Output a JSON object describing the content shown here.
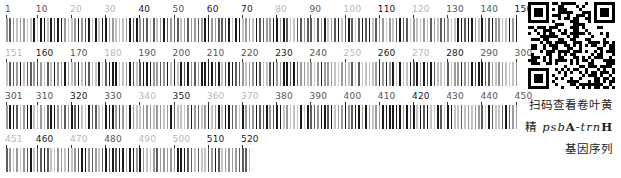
{
  "figure": {
    "rows": [
      {
        "start": 1,
        "end": 150,
        "labels": [
          {
            "text": "1",
            "pos": 1,
            "tone": "mid"
          },
          {
            "text": "10",
            "pos": 10,
            "tone": "mid"
          },
          {
            "text": "20",
            "pos": 20,
            "tone": "light"
          },
          {
            "text": "30",
            "pos": 30,
            "tone": "light"
          },
          {
            "text": "40",
            "pos": 40,
            "tone": "dark"
          },
          {
            "text": "50",
            "pos": 50,
            "tone": "mid"
          },
          {
            "text": "60",
            "pos": 60,
            "tone": "dark"
          },
          {
            "text": "70",
            "pos": 70,
            "tone": "dark"
          },
          {
            "text": "80",
            "pos": 80,
            "tone": "light"
          },
          {
            "text": "90",
            "pos": 90,
            "tone": "mid"
          },
          {
            "text": "100",
            "pos": 100,
            "tone": "light"
          },
          {
            "text": "110",
            "pos": 110,
            "tone": "dark"
          },
          {
            "text": "120",
            "pos": 120,
            "tone": "light"
          },
          {
            "text": "130",
            "pos": 130,
            "tone": "mid"
          },
          {
            "text": "140",
            "pos": 140,
            "tone": "mid"
          },
          {
            "text": "150",
            "pos": 150,
            "tone": "dark"
          }
        ]
      },
      {
        "start": 151,
        "end": 300,
        "labels": [
          {
            "text": "151",
            "pos": 151,
            "tone": "light"
          },
          {
            "text": "160",
            "pos": 160,
            "tone": "dark"
          },
          {
            "text": "170",
            "pos": 170,
            "tone": "mid"
          },
          {
            "text": "180",
            "pos": 180,
            "tone": "light"
          },
          {
            "text": "190",
            "pos": 190,
            "tone": "mid"
          },
          {
            "text": "200",
            "pos": 200,
            "tone": "mid"
          },
          {
            "text": "210",
            "pos": 210,
            "tone": "mid"
          },
          {
            "text": "220",
            "pos": 220,
            "tone": "mid"
          },
          {
            "text": "230",
            "pos": 230,
            "tone": "dark"
          },
          {
            "text": "240",
            "pos": 240,
            "tone": "mid"
          },
          {
            "text": "250",
            "pos": 250,
            "tone": "light"
          },
          {
            "text": "260",
            "pos": 260,
            "tone": "dark"
          },
          {
            "text": "270",
            "pos": 270,
            "tone": "light"
          },
          {
            "text": "280",
            "pos": 280,
            "tone": "dark"
          },
          {
            "text": "290",
            "pos": 290,
            "tone": "mid"
          },
          {
            "text": "300",
            "pos": 300,
            "tone": "mid"
          }
        ]
      },
      {
        "start": 301,
        "end": 450,
        "labels": [
          {
            "text": "301",
            "pos": 301,
            "tone": "mid"
          },
          {
            "text": "310",
            "pos": 310,
            "tone": "mid"
          },
          {
            "text": "320",
            "pos": 320,
            "tone": "dark"
          },
          {
            "text": "330",
            "pos": 330,
            "tone": "mid"
          },
          {
            "text": "340",
            "pos": 340,
            "tone": "light"
          },
          {
            "text": "350",
            "pos": 350,
            "tone": "dark"
          },
          {
            "text": "360",
            "pos": 360,
            "tone": "light"
          },
          {
            "text": "370",
            "pos": 370,
            "tone": "light"
          },
          {
            "text": "380",
            "pos": 380,
            "tone": "mid"
          },
          {
            "text": "390",
            "pos": 390,
            "tone": "mid"
          },
          {
            "text": "400",
            "pos": 400,
            "tone": "mid"
          },
          {
            "text": "410",
            "pos": 410,
            "tone": "mid"
          },
          {
            "text": "420",
            "pos": 420,
            "tone": "dark"
          },
          {
            "text": "430",
            "pos": 430,
            "tone": "mid"
          },
          {
            "text": "440",
            "pos": 440,
            "tone": "mid"
          },
          {
            "text": "450",
            "pos": 450,
            "tone": "mid"
          }
        ]
      },
      {
        "start": 451,
        "end": 522,
        "labels": [
          {
            "text": "451",
            "pos": 451,
            "tone": "light"
          },
          {
            "text": "460",
            "pos": 460,
            "tone": "dark"
          },
          {
            "text": "470",
            "pos": 470,
            "tone": "light"
          },
          {
            "text": "480",
            "pos": 480,
            "tone": "mid"
          },
          {
            "text": "490",
            "pos": 490,
            "tone": "light"
          },
          {
            "text": "500",
            "pos": 500,
            "tone": "light"
          },
          {
            "text": "510",
            "pos": 510,
            "tone": "dark"
          },
          {
            "text": "520",
            "pos": 520,
            "tone": "dark"
          }
        ]
      }
    ],
    "sequence_length": 522,
    "colors": {
      "A": "#1a1a1a",
      "T": "#5c5c5c",
      "C": "#9a9a9a",
      "G": "#c4c4c4"
    }
  },
  "qr": {
    "label": "qr-code"
  },
  "caption": {
    "line1": "扫码查看卷叶黄",
    "line2_prefix": "精 ",
    "line2_gene1_italic": "psb",
    "line2_gene1_bold": "A",
    "line2_dash": "-",
    "line2_gene2_italic": "trn",
    "line2_gene2_bold": "H",
    "line3": "基因序列"
  }
}
